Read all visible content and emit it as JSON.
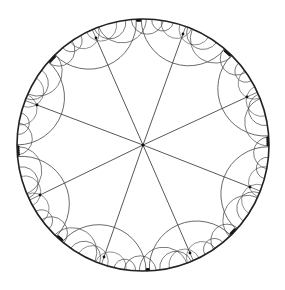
{
  "diagram": {
    "type": "poincare-disk-hyperbolic-tiling",
    "canvas": {
      "width": 285,
      "height": 290,
      "background": "#ffffff"
    },
    "disk": {
      "cx": 143,
      "cy": 145,
      "r": 126,
      "stroke": "#222222",
      "stroke_width": 1.6
    },
    "center_node": {
      "x": 143,
      "y": 145
    },
    "line_color": "#444444",
    "radial_count": 8,
    "vertices": [
      {
        "x": 96,
        "y": 38
      },
      {
        "x": 183,
        "y": 34
      },
      {
        "x": 247,
        "y": 97
      },
      {
        "x": 250,
        "y": 187
      },
      {
        "x": 190,
        "y": 253
      },
      {
        "x": 104,
        "y": 257
      },
      {
        "x": 40,
        "y": 195
      },
      {
        "x": 37,
        "y": 105
      }
    ],
    "fan_arcs_per_vertex": 5,
    "boundary_levels": 3
  }
}
